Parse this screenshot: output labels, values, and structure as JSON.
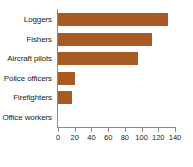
{
  "chart_data": {
    "type": "bar",
    "orientation": "horizontal",
    "title": "",
    "xlabel": "",
    "ylabel": "",
    "categories": [
      "Loggers",
      "Fishers",
      "Aircraft pilots",
      "Police officers",
      "Firefighters",
      "Office workers"
    ],
    "values": [
      132,
      113,
      96,
      20,
      17,
      0
    ],
    "xlim": [
      0,
      140
    ],
    "xticks": [
      0,
      20,
      40,
      60,
      80,
      100,
      120,
      140
    ],
    "xtick_labels": [
      "0",
      "20",
      "40",
      "60",
      "80",
      "100",
      "120",
      "140"
    ],
    "grid": false,
    "legend": false,
    "bar_color": "#A85A22",
    "axis_color": "#8a8a8a",
    "text_color": "#1c1c1c"
  }
}
